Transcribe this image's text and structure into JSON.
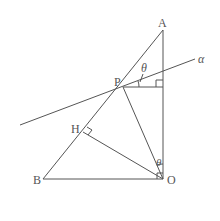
{
  "diagram": {
    "points": {
      "A": {
        "label": "A",
        "x": 163,
        "y": 30
      },
      "P": {
        "label": "P",
        "x": 123,
        "y": 87
      },
      "H": {
        "label": "H",
        "x": 83,
        "y": 132
      },
      "B": {
        "label": "B",
        "x": 43,
        "y": 179
      },
      "O": {
        "label": "O",
        "x": 163,
        "y": 179
      }
    },
    "line_label": "α",
    "angle_label_top": "θ",
    "angle_label_bottom": "θ",
    "segments": [
      "AB",
      "AO",
      "BO",
      "PO",
      "OH",
      "P-foot on AO",
      "line α through P"
    ],
    "right_angles": [
      "at O (BO ⟂ AO)",
      "at H (OH ⟂ AB)",
      "at foot of perpendicular from P to AO"
    ]
  }
}
